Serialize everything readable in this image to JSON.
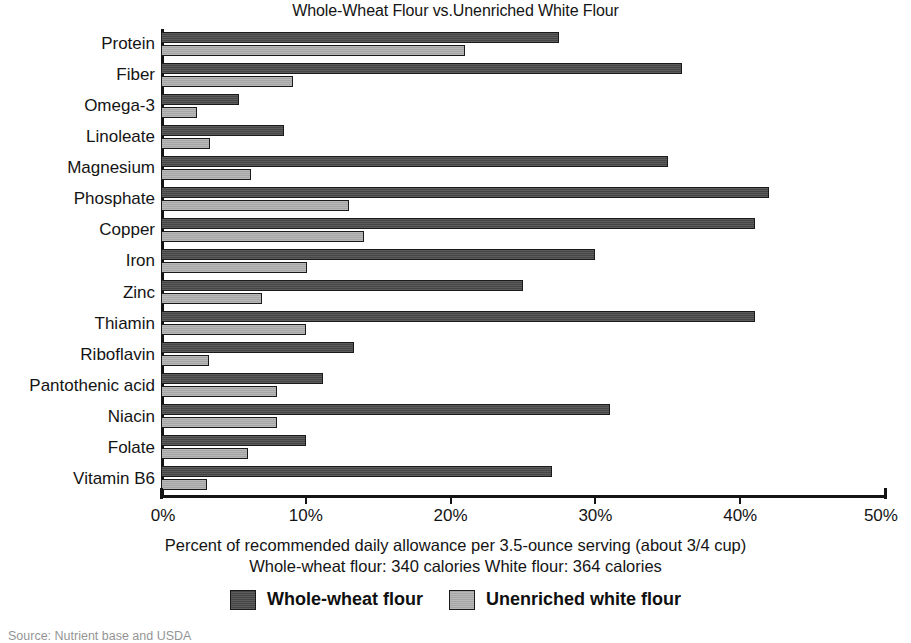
{
  "chart_data": {
    "type": "bar",
    "orientation": "horizontal",
    "title": "Whole-Wheat Flour vs.Unenriched White Flour",
    "xlabel": "Percent of recommended daily allowance per 3.5-ounce serving (about 3/4 cup)",
    "ylabel": "",
    "xlim": [
      0,
      50
    ],
    "grid": false,
    "legend_position": "bottom",
    "tick_labels": [
      "0%",
      "10%",
      "20%",
      "30%",
      "40%",
      "50%"
    ],
    "tick_values": [
      0,
      10,
      20,
      30,
      40,
      50
    ],
    "categories": [
      "Protein",
      "Fiber",
      "Omega-3",
      "Linoleate",
      "Magnesium",
      "Phosphate",
      "Copper",
      "Iron",
      "Zinc",
      "Thiamin",
      "Riboflavin",
      "Pantothenic acid",
      "Niacin",
      "Folate",
      "Vitamin B6"
    ],
    "series": [
      {
        "name": "Whole-wheat flour",
        "color": "#4a4a4a",
        "values": [
          27.5,
          36,
          5.4,
          8.5,
          35,
          42,
          41,
          30,
          25,
          41,
          13.3,
          11.2,
          31,
          10,
          27
        ]
      },
      {
        "name": "Unenriched white flour",
        "color": "#b0b0b0",
        "values": [
          21,
          9.1,
          2.5,
          3.4,
          6.2,
          13,
          14,
          10.1,
          7,
          10,
          3.3,
          8,
          8,
          6,
          3.2
        ]
      }
    ],
    "annotations": [
      "Percent of recommended daily allowance per 3.5-ounce serving (about 3/4 cup)",
      "Whole-wheat flour: 340 calories   White flour: 364 calories"
    ]
  },
  "caption": {
    "line1": "Percent of recommended daily allowance per 3.5-ounce serving (about 3/4 cup)",
    "line2": "Whole-wheat flour: 340 calories   White flour: 364 calories"
  },
  "legend": {
    "entries": [
      {
        "label": "Whole-wheat flour",
        "color": "#4a4a4a"
      },
      {
        "label": "Unenriched white flour",
        "color": "#b0b0b0"
      }
    ]
  },
  "source_note": "Source: Nutrient base and USDA",
  "colors": {
    "whole_wheat": "#4a4a4a",
    "white_flour": "#b0b0b0",
    "axis": "#141414",
    "text": "#141414",
    "background": "#ffffff"
  }
}
